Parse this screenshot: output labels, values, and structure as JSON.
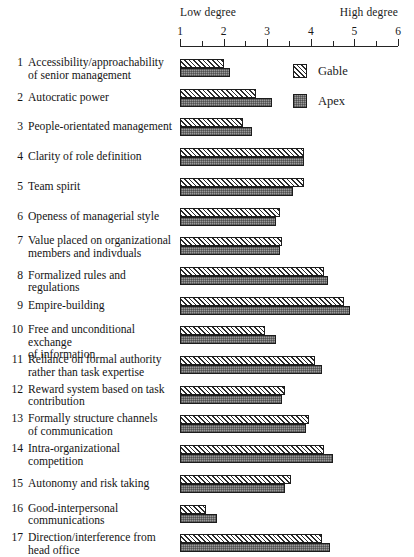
{
  "axis": {
    "low_label": "Low degree",
    "high_label": "High degree",
    "ticks": [
      1,
      2,
      3,
      4,
      5,
      6
    ],
    "tick_labels": [
      "1",
      "2",
      "3",
      "4",
      "5",
      "6"
    ]
  },
  "legend": {
    "items": [
      {
        "key": "gable",
        "label": "Gable",
        "pattern": "diagonal-hatch"
      },
      {
        "key": "apex",
        "label": "Apex",
        "pattern": "gray-stipple"
      }
    ]
  },
  "chart_data": {
    "type": "bar",
    "orientation": "horizontal",
    "title": "",
    "subtitle": "",
    "xlabel": "",
    "ylabel": "",
    "xlim": [
      1,
      6
    ],
    "xticks": [
      1,
      2,
      3,
      4,
      5,
      6
    ],
    "minor_ticks": [
      1.5,
      2.5,
      3.5,
      4.5,
      5.5
    ],
    "grid": false,
    "legend_position": "top-right",
    "axis_low_annotation": "Low degree",
    "axis_high_annotation": "High degree",
    "categories": [
      "Accessibility/approachability of senior management",
      "Autocratic power",
      "People-orientated management",
      "Clarity of role definition",
      "Team spirit",
      "Openess of managerial style",
      "Value placed on organizational members and indivduals",
      "Formalized rules and regulations",
      "Empire-building",
      "Free and unconditional exchange of information",
      "Reliance on formal authority rather than task expertise",
      "Reward system based on task contribution",
      "Formally structure channels of communication",
      "Intra-organizational competition",
      "Autonomy and risk taking",
      "Good-interpersonal communications",
      "Direction/interference from head office"
    ],
    "series": [
      {
        "name": "Gable",
        "values": [
          2.0,
          2.75,
          2.45,
          3.85,
          3.85,
          3.3,
          3.35,
          4.3,
          4.75,
          2.95,
          4.1,
          3.4,
          3.95,
          4.3,
          3.55,
          1.6,
          4.25
        ]
      },
      {
        "name": "Apex",
        "values": [
          2.15,
          3.1,
          2.65,
          3.85,
          3.6,
          3.2,
          3.3,
          4.4,
          4.9,
          3.2,
          4.25,
          3.35,
          3.9,
          4.5,
          3.4,
          1.85,
          4.45
        ]
      }
    ]
  },
  "rows": [
    {
      "num": "1",
      "lines": [
        "Accessibility/approachability",
        "of senior management"
      ]
    },
    {
      "num": "2",
      "lines": [
        "Autocratic power"
      ]
    },
    {
      "num": "3",
      "lines": [
        "People-orientated management"
      ]
    },
    {
      "num": "4",
      "lines": [
        "Clarity of role definition"
      ]
    },
    {
      "num": "5",
      "lines": [
        "Team spirit"
      ]
    },
    {
      "num": "6",
      "lines": [
        "Openess of managerial style"
      ]
    },
    {
      "num": "7",
      "lines": [
        "Value placed on organizational",
        "members and indivduals"
      ]
    },
    {
      "num": "8",
      "lines": [
        "Formalized rules and regulations"
      ]
    },
    {
      "num": "9",
      "lines": [
        "Empire-building"
      ]
    },
    {
      "num": "10",
      "lines": [
        "Free and unconditional exchange",
        "of information"
      ]
    },
    {
      "num": "11",
      "lines": [
        "Reliance on formal authority",
        "rather than task expertise"
      ]
    },
    {
      "num": "12",
      "lines": [
        "Reward system based on task",
        "contribution"
      ]
    },
    {
      "num": "13",
      "lines": [
        "Formally structure channels",
        "of communication"
      ]
    },
    {
      "num": "14",
      "lines": [
        "Intra-organizational",
        "competition"
      ]
    },
    {
      "num": "15",
      "lines": [
        "Autonomy and risk taking"
      ]
    },
    {
      "num": "16",
      "lines": [
        "Good-interpersonal",
        "communications"
      ]
    },
    {
      "num": "17",
      "lines": [
        "Direction/interference from",
        "head office"
      ]
    }
  ],
  "geometry": {
    "axis_x_start": 180,
    "axis_x_end": 398,
    "rows_top": 59,
    "row_pitch": 29.7
  },
  "colors": {
    "ink": "#1a1a1a",
    "apex_fill": "#9a9a9a",
    "background": "#ffffff"
  }
}
